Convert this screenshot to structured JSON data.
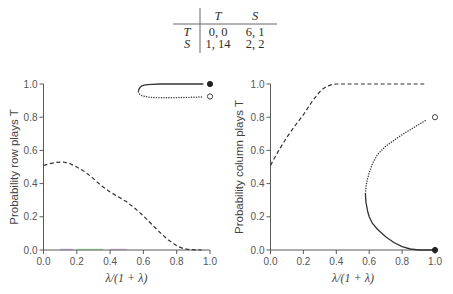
{
  "payoff_table": {
    "col_headers": [
      "T",
      "S"
    ],
    "rows": [
      {
        "label": "T",
        "cells": [
          "0, 0",
          "6, 1"
        ]
      },
      {
        "label": "S",
        "cells": [
          "1, 14",
          "2, 2"
        ]
      }
    ]
  },
  "colors": {
    "line": "#333333",
    "axis": "#5a5a5a",
    "tick_text": "#555555"
  },
  "chart_data": [
    {
      "type": "line",
      "title": "",
      "xlabel": "λ/(1 + λ)",
      "ylabel": "Probability row plays T",
      "xlim": [
        0,
        1
      ],
      "ylim": [
        0,
        1
      ],
      "xticks": [
        "0.0",
        "0.2",
        "0.4",
        "0.6",
        "0.8",
        "1.0"
      ],
      "yticks": [
        "0.0",
        "0.2",
        "0.4",
        "0.6",
        "0.8",
        "1.0"
      ],
      "grid": false,
      "legend": null,
      "series": [
        {
          "name": "dashed branch",
          "style": "dashed",
          "x": [
            0.0,
            0.04,
            0.08,
            0.12,
            0.16,
            0.2,
            0.25,
            0.3,
            0.35,
            0.4,
            0.45,
            0.5,
            0.55,
            0.6,
            0.65,
            0.7,
            0.75,
            0.8,
            0.84,
            0.88,
            0.95
          ],
          "y": [
            0.51,
            0.52,
            0.528,
            0.53,
            0.52,
            0.5,
            0.47,
            0.43,
            0.385,
            0.35,
            0.32,
            0.29,
            0.25,
            0.205,
            0.155,
            0.105,
            0.06,
            0.025,
            0.008,
            0.002,
            0.0
          ]
        },
        {
          "name": "solid branch",
          "style": "solid",
          "x": [
            0.57,
            0.573,
            0.58,
            0.59,
            0.605,
            0.625,
            0.65,
            0.7,
            0.8,
            0.9,
            0.96
          ],
          "y": [
            0.955,
            0.968,
            0.98,
            0.988,
            0.993,
            0.996,
            0.998,
            1.0,
            1.0,
            1.0,
            1.0
          ]
        },
        {
          "name": "dotted branch",
          "style": "dotted",
          "x": [
            0.57,
            0.575,
            0.59,
            0.61,
            0.64,
            0.68,
            0.75,
            0.85,
            0.95
          ],
          "y": [
            0.952,
            0.94,
            0.93,
            0.925,
            0.92,
            0.918,
            0.917,
            0.919,
            0.922
          ]
        }
      ],
      "markers": [
        {
          "x": 1.0,
          "y": 1.0,
          "fill": "filled"
        },
        {
          "x": 1.0,
          "y": 0.925,
          "fill": "open"
        }
      ],
      "baseline_marks": [
        {
          "x0": 0.1,
          "x1": 0.18,
          "color": "#b98ac9"
        },
        {
          "x0": 0.2,
          "x1": 0.36,
          "color": "#6fdc6f"
        },
        {
          "x0": 0.4,
          "x1": 0.5,
          "color": "#b98ac9"
        }
      ]
    },
    {
      "type": "line",
      "title": "",
      "xlabel": "λ/(1 + λ)",
      "ylabel": "Probability column plays T",
      "xlim": [
        0,
        1
      ],
      "ylim": [
        0,
        1
      ],
      "xticks": [
        "0.0",
        "0.2",
        "0.4",
        "0.6",
        "0.8",
        "1.0"
      ],
      "yticks": [
        "0.0",
        "0.2",
        "0.4",
        "0.6",
        "0.8",
        "1.0"
      ],
      "grid": false,
      "legend": null,
      "series": [
        {
          "name": "dashed branch",
          "style": "dashed",
          "x": [
            0.0,
            0.05,
            0.1,
            0.15,
            0.2,
            0.25,
            0.28,
            0.31,
            0.34,
            0.37,
            0.4,
            0.5,
            0.6,
            0.7,
            0.8,
            0.95
          ],
          "y": [
            0.51,
            0.6,
            0.68,
            0.75,
            0.815,
            0.89,
            0.93,
            0.965,
            0.985,
            0.995,
            1.0,
            1.0,
            1.0,
            1.0,
            1.0,
            1.0
          ]
        },
        {
          "name": "dotted branch",
          "style": "dotted",
          "x": [
            0.577,
            0.58,
            0.59,
            0.6,
            0.62,
            0.65,
            0.7,
            0.75,
            0.8,
            0.85,
            0.9,
            0.95
          ],
          "y": [
            0.34,
            0.38,
            0.43,
            0.465,
            0.52,
            0.575,
            0.625,
            0.66,
            0.695,
            0.725,
            0.755,
            0.785
          ]
        },
        {
          "name": "solid branch",
          "style": "solid",
          "x": [
            0.577,
            0.58,
            0.59,
            0.6,
            0.62,
            0.65,
            0.7,
            0.75,
            0.8,
            0.85,
            0.9,
            1.0
          ],
          "y": [
            0.34,
            0.29,
            0.235,
            0.2,
            0.16,
            0.125,
            0.08,
            0.045,
            0.02,
            0.006,
            0.0,
            0.0
          ]
        }
      ],
      "markers": [
        {
          "x": 1.0,
          "y": 0.0,
          "fill": "filled"
        },
        {
          "x": 1.0,
          "y": 0.8,
          "fill": "open"
        }
      ],
      "baseline_marks": []
    }
  ]
}
